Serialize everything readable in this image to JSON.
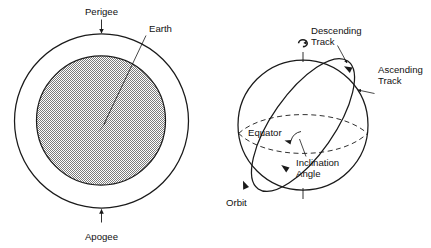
{
  "figure": {
    "background_color": "#ffffff",
    "ink_color": "#1a1a1a",
    "earth_fill_color": "#b8b8b8",
    "panels": [
      {
        "id": "elliptical-orbit-panel",
        "name": "Perigee and apogee diagram",
        "labels": {
          "perigee": "Perigee",
          "apogee": "Apogee",
          "earth": "Earth"
        },
        "elements": {
          "outer_circle_name": "orbit-circle",
          "inner_circle_name": "earth-disc",
          "perigee_arrow_direction": "down",
          "apogee_arrow_direction": "up",
          "earth_leader_direction": "down-left"
        }
      },
      {
        "id": "inclination-panel",
        "name": "Orbit inclination diagram",
        "labels": {
          "descending_track": "Descending\nTrack",
          "descending_track_line1": "Descending",
          "descending_track_line2": "Track",
          "ascending_track_line1": "Ascending",
          "ascending_track_line2": "Track",
          "equator": "Equator",
          "inclination_angle_line1": "Inclination",
          "inclination_angle_line2": "Angle",
          "orbit": "Orbit"
        },
        "elements": {
          "sphere_name": "earth-sphere",
          "equator_style": "dashed-ellipse",
          "orbit_style": "solid-tilted-ellipse",
          "rotation_symbol": "earth-rotation-icon",
          "polar_axis_top": "north-pole-axis-tick",
          "polar_axis_bottom": "south-pole-axis-tick"
        }
      }
    ]
  }
}
